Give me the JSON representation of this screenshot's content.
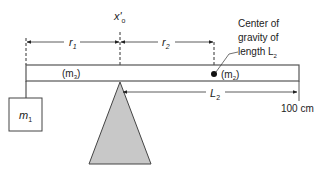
{
  "diagram": {
    "pivot_label": "x'",
    "pivot_sub": "o",
    "r1_label": "r",
    "r1_sub": "1",
    "r2_label": "r",
    "r2_sub": "2",
    "m3_label": "(m",
    "m3_sub": "3",
    "m3_close": ")",
    "m2_label": "(m",
    "m2_sub": "2",
    "m2_close": ")",
    "m1_label": "m",
    "m1_sub": "1",
    "L2_label": "L",
    "L2_sub": "2",
    "end_label": "100 cm",
    "cg_line1": "Center of",
    "cg_line2": "gravity of",
    "cg_line3": "length L",
    "cg_sub": "2",
    "colors": {
      "line": "#333333",
      "fulcrum_fill": "#c8c8c8",
      "beam_fill": "#ffffff"
    }
  }
}
